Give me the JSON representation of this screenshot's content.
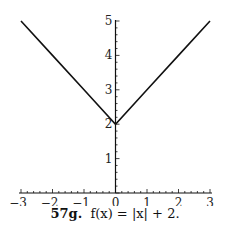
{
  "chart_data": {
    "type": "line",
    "xlabel": "",
    "ylabel": "",
    "xlim": [
      -3,
      3
    ],
    "ylim": [
      0,
      5
    ],
    "x_ticks": [
      -3,
      -2,
      -1,
      0,
      1,
      2,
      3
    ],
    "y_ticks": [
      1,
      2,
      3,
      4,
      5
    ],
    "grid": false,
    "legend": null,
    "series": [
      {
        "name": "f(x) = |x| + 2",
        "x": [
          -3,
          -2,
          -1,
          0,
          1,
          2,
          3
        ],
        "y": [
          5,
          4,
          3,
          2,
          3,
          4,
          5
        ]
      }
    ]
  },
  "caption": {
    "label": "57g.",
    "formula": "f(x) = |x| + 2."
  },
  "style": {
    "line_color": "#111111",
    "axis_color": "#111111"
  }
}
